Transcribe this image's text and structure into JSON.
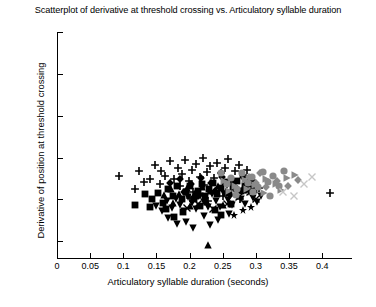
{
  "chart_data": {
    "type": "scatter",
    "title": "Scatterplot of derivative at threshold crossing vs. Articulatory syllable duration",
    "xlabel": "Articulatory syllable duration (seconds)",
    "ylabel": "Derivative of position at threshold crossing",
    "xlim": [
      0,
      0.445
    ],
    "ylim": [
      0.03,
      0.3
    ],
    "grid": false,
    "legend": false,
    "xticks": [
      0,
      0.05,
      0.1,
      0.15,
      0.2,
      0.25,
      0.3,
      0.35,
      0.4
    ],
    "xticklabels": [
      "0",
      "0.05",
      "0.1",
      "0.15",
      "0.2",
      "0.25",
      "0.3",
      "0.35",
      "0.4"
    ],
    "yticks": [
      0.05,
      0.1,
      0.15,
      0.2,
      0.25,
      0.3
    ],
    "yticklabels": [
      "0.05",
      "0.1",
      "0.15",
      "0.2",
      "0.25",
      "0.3"
    ],
    "marker_colors": {
      "black": "#000000",
      "gray": "#8a8a8a",
      "light": "#c6c6c6"
    },
    "series": [
      {
        "name": "plus-black",
        "marker": "plus",
        "color": "#000000",
        "points": [
          [
            0.094,
            0.1285
          ],
          [
            0.124,
            0.1335
          ],
          [
            0.131,
            0.1205
          ],
          [
            0.148,
            0.1415
          ],
          [
            0.157,
            0.1345
          ],
          [
            0.163,
            0.1275
          ],
          [
            0.17,
            0.1455
          ],
          [
            0.176,
            0.124
          ],
          [
            0.182,
            0.138
          ],
          [
            0.188,
            0.13
          ],
          [
            0.193,
            0.1465
          ],
          [
            0.199,
            0.1225
          ],
          [
            0.204,
            0.1355
          ],
          [
            0.21,
            0.142
          ],
          [
            0.215,
            0.127
          ],
          [
            0.22,
            0.15
          ],
          [
            0.226,
            0.133
          ],
          [
            0.231,
            0.1395
          ],
          [
            0.237,
            0.125
          ],
          [
            0.242,
            0.144
          ],
          [
            0.247,
            0.131
          ],
          [
            0.253,
            0.137
          ],
          [
            0.258,
            0.148
          ],
          [
            0.264,
            0.1235
          ],
          [
            0.269,
            0.1345
          ],
          [
            0.275,
            0.141
          ],
          [
            0.281,
            0.129
          ],
          [
            0.287,
            0.1355
          ],
          [
            0.186,
            0.1155
          ],
          [
            0.205,
            0.109
          ],
          [
            0.222,
            0.117
          ],
          [
            0.24,
            0.1105
          ],
          [
            0.256,
            0.1185
          ],
          [
            0.272,
            0.112
          ],
          [
            0.288,
            0.12
          ],
          [
            0.304,
            0.114
          ],
          [
            0.2,
            0.102
          ],
          [
            0.228,
            0.0985
          ],
          [
            0.251,
            0.1045
          ],
          [
            0.276,
            0.1
          ],
          [
            0.117,
            0.1125
          ],
          [
            0.14,
            0.124
          ],
          [
            0.155,
            0.118
          ],
          [
            0.412,
            0.1075
          ]
        ]
      },
      {
        "name": "square-black",
        "marker": "square",
        "color": "#000000",
        "points": [
          [
            0.118,
            0.093
          ],
          [
            0.144,
            0.1
          ],
          [
            0.152,
            0.1075
          ],
          [
            0.16,
            0.096
          ],
          [
            0.168,
            0.112
          ],
          [
            0.175,
            0.1035
          ],
          [
            0.181,
            0.1155
          ],
          [
            0.188,
            0.1
          ],
          [
            0.194,
            0.109
          ],
          [
            0.2,
            0.1165
          ],
          [
            0.206,
            0.101
          ],
          [
            0.212,
            0.11
          ],
          [
            0.218,
            0.118
          ],
          [
            0.224,
            0.104
          ],
          [
            0.23,
            0.1125
          ],
          [
            0.236,
            0.1195
          ],
          [
            0.242,
            0.106
          ],
          [
            0.248,
            0.114
          ],
          [
            0.254,
            0.1205
          ],
          [
            0.26,
            0.1075
          ],
          [
            0.266,
            0.115
          ],
          [
            0.272,
            0.1215
          ],
          [
            0.278,
            0.1095
          ],
          [
            0.284,
            0.1165
          ],
          [
            0.291,
            0.1225
          ],
          [
            0.297,
            0.111
          ],
          [
            0.164,
            0.0885
          ],
          [
            0.19,
            0.0845
          ],
          [
            0.215,
            0.0925
          ],
          [
            0.238,
            0.087
          ],
          [
            0.262,
            0.095
          ],
          [
            0.176,
            0.079
          ],
          [
            0.247,
            0.0815
          ],
          [
            0.133,
            0.106
          ],
          [
            0.14,
            0.0915
          ]
        ]
      },
      {
        "name": "triangle-down-black",
        "marker": "triangle-down",
        "color": "#000000",
        "points": [
          [
            0.15,
            0.0925
          ],
          [
            0.158,
            0.086
          ],
          [
            0.166,
            0.098
          ],
          [
            0.173,
            0.09
          ],
          [
            0.18,
            0.101
          ],
          [
            0.186,
            0.0935
          ],
          [
            0.192,
            0.0865
          ],
          [
            0.198,
            0.103
          ],
          [
            0.204,
            0.0955
          ],
          [
            0.21,
            0.089
          ],
          [
            0.216,
            0.1045
          ],
          [
            0.222,
            0.097
          ],
          [
            0.228,
            0.0905
          ],
          [
            0.234,
            0.106
          ],
          [
            0.24,
            0.0985
          ],
          [
            0.246,
            0.0915
          ],
          [
            0.252,
            0.107
          ],
          [
            0.258,
            0.0995
          ],
          [
            0.264,
            0.093
          ],
          [
            0.27,
            0.108
          ],
          [
            0.277,
            0.1005
          ],
          [
            0.283,
            0.0945
          ],
          [
            0.289,
            0.109
          ],
          [
            0.296,
            0.102
          ],
          [
            0.168,
            0.0775
          ],
          [
            0.195,
            0.0735
          ],
          [
            0.221,
            0.08
          ],
          [
            0.243,
            0.0755
          ],
          [
            0.259,
            0.0825
          ],
          [
            0.231,
            0.069
          ],
          [
            0.205,
            0.066
          ],
          [
            0.181,
            0.0705
          ],
          [
            0.302,
            0.0965
          ],
          [
            0.308,
            0.1035
          ]
        ]
      },
      {
        "name": "triangle-up-black",
        "marker": "triangle-up",
        "color": "#000000",
        "points": [
          [
            0.161,
            0.105
          ],
          [
            0.172,
            0.112
          ],
          [
            0.184,
            0.1065
          ],
          [
            0.196,
            0.1135
          ],
          [
            0.208,
            0.108
          ],
          [
            0.219,
            0.115
          ],
          [
            0.231,
            0.1095
          ],
          [
            0.243,
            0.116
          ],
          [
            0.255,
            0.1105
          ],
          [
            0.267,
            0.117
          ],
          [
            0.279,
            0.1115
          ],
          [
            0.29,
            0.118
          ],
          [
            0.175,
            0.096
          ],
          [
            0.2,
            0.092
          ],
          [
            0.226,
            0.0975
          ],
          [
            0.25,
            0.0935
          ],
          [
            0.228,
            0.045
          ]
        ]
      },
      {
        "name": "diamond-black",
        "marker": "diamond",
        "color": "#000000",
        "points": [
          [
            0.17,
            0.1195
          ],
          [
            0.186,
            0.1245
          ],
          [
            0.202,
            0.119
          ],
          [
            0.217,
            0.1255
          ],
          [
            0.233,
            0.12
          ],
          [
            0.249,
            0.1265
          ],
          [
            0.265,
            0.121
          ],
          [
            0.28,
            0.127
          ],
          [
            0.296,
            0.1225
          ],
          [
            0.191,
            0.1085
          ],
          [
            0.213,
            0.104
          ],
          [
            0.238,
            0.11
          ],
          [
            0.261,
            0.1055
          ],
          [
            0.285,
            0.1115
          ]
        ]
      },
      {
        "name": "x-black",
        "marker": "x",
        "color": "#000000",
        "points": [
          [
            0.196,
            0.0895
          ],
          [
            0.213,
            0.095
          ],
          [
            0.236,
            0.088
          ],
          [
            0.257,
            0.094
          ],
          [
            0.274,
            0.1025
          ],
          [
            0.291,
            0.1085
          ],
          [
            0.3,
            0.1
          ]
        ]
      },
      {
        "name": "star-black",
        "marker": "star",
        "color": "#000000",
        "points": [
          [
            0.281,
            0.087
          ],
          [
            0.267,
            0.0815
          ],
          [
            0.293,
            0.0915
          ]
        ]
      },
      {
        "name": "circle-gray",
        "marker": "circle",
        "color": "#8a8a8a",
        "points": [
          [
            0.247,
            0.131
          ],
          [
            0.263,
            0.1255
          ],
          [
            0.279,
            0.132
          ],
          [
            0.294,
            0.1265
          ],
          [
            0.31,
            0.133
          ],
          [
            0.326,
            0.1275
          ],
          [
            0.342,
            0.134
          ],
          [
            0.256,
            0.118
          ],
          [
            0.272,
            0.113
          ],
          [
            0.288,
            0.1195
          ],
          [
            0.303,
            0.1145
          ],
          [
            0.319,
            0.1205
          ],
          [
            0.335,
            0.1155
          ],
          [
            0.27,
            0.1055
          ],
          [
            0.296,
            0.1085
          ],
          [
            0.322,
            0.104
          ]
        ]
      },
      {
        "name": "triangle-right-gray",
        "marker": "triangle-right",
        "color": "#8a8a8a",
        "points": [
          [
            0.252,
            0.1225
          ],
          [
            0.268,
            0.1165
          ],
          [
            0.284,
            0.1235
          ],
          [
            0.299,
            0.1175
          ],
          [
            0.315,
            0.1245
          ],
          [
            0.331,
            0.1185
          ],
          [
            0.347,
            0.125
          ],
          [
            0.359,
            0.129
          ],
          [
            0.26,
            0.1095
          ],
          [
            0.286,
            0.112
          ],
          [
            0.312,
            0.108
          ],
          [
            0.338,
            0.1115
          ]
        ]
      },
      {
        "name": "diamond-gray",
        "marker": "diamond",
        "color": "#8a8a8a",
        "points": [
          [
            0.3,
            0.1195
          ],
          [
            0.316,
            0.115
          ],
          [
            0.332,
            0.1215
          ],
          [
            0.348,
            0.1165
          ],
          [
            0.364,
            0.123
          ],
          [
            0.29,
            0.1265
          ],
          [
            0.306,
            0.131
          ]
        ]
      },
      {
        "name": "x-light",
        "marker": "x",
        "color": "#c6c6c6",
        "points": [
          [
            0.384,
            0.127
          ],
          [
            0.341,
            0.109
          ],
          [
            0.357,
            0.1045
          ],
          [
            0.372,
            0.1185
          ]
        ]
      }
    ]
  },
  "footer": {
    "fragment": "",
    "note": ""
  }
}
